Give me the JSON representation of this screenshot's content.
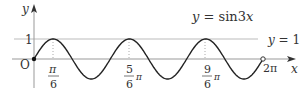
{
  "chart_data": {
    "type": "line",
    "title": "y = sin3x",
    "function": "sin(3x)",
    "xlabel": "x",
    "ylabel": "y",
    "origin_label": "O",
    "xlim": [
      0,
      6.2832
    ],
    "ylim": [
      -1,
      1
    ],
    "grid": false,
    "reference_line": {
      "label": "y = 1",
      "y": 1
    },
    "x_ticks": [
      {
        "num": "π",
        "den": "6",
        "suffix": "",
        "value": 0.5236
      },
      {
        "num": "5",
        "den": "6",
        "suffix": "π",
        "value": 2.618
      },
      {
        "num": "9",
        "den": "6",
        "suffix": "π",
        "value": 4.7124
      }
    ],
    "x_end_label": "2π",
    "y_tick_label": "1",
    "points": [
      {
        "x": 0,
        "y": 0,
        "marker": "filled"
      },
      {
        "x": 6.2832,
        "y": 0,
        "marker": "open"
      }
    ],
    "colors": {
      "curve": "#222222",
      "axis": "#999999",
      "ref_line": "#bbbbbb",
      "text": "#333333"
    }
  }
}
